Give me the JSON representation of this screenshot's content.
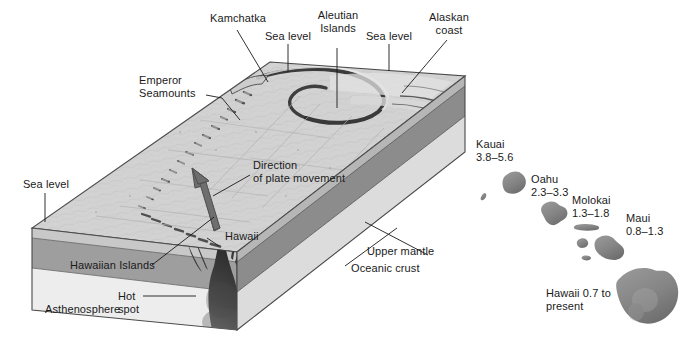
{
  "figure": {
    "colors": {
      "seafloor_light": "#d2d2d2",
      "seafloor_mid": "#b8b8b8",
      "crust_band": "#c4c4c4",
      "upper_mantle_band": "#9a9a9a",
      "asthenosphere_band": "#e9e9e9",
      "side_face": "#9d9d9d",
      "plume_dark": "#3a3a3a",
      "island_gray": "#8a8a8a",
      "arrow_gray": "#6e6e6e",
      "leader_line": "#1a1a1a",
      "text": "#1a1a1a"
    }
  },
  "labels": {
    "kamchatka": "Kamchatka",
    "sea_level_top": "Sea level",
    "aleutian_islands": "Aleutian\nIslands",
    "sea_level_top_right": "Sea level",
    "alaskan_coast": "Alaskan\ncoast",
    "emperor_seamounts": "Emperor\nSeamounts",
    "direction_of_plate_movement": "Direction\nof plate movement",
    "sea_level_left": "Sea level",
    "hawaiian_islands": "Hawaiian Islands",
    "asthenosphere": "Asthenosphere",
    "hot_spot": "Hot\nspot",
    "hawaii_block": "Hawaii",
    "upper_mantle": "Upper mantle",
    "oceanic_crust": "Oceanic crust"
  },
  "island_chain": {
    "kauai": {
      "name": "Kauai",
      "age": "3.8–5.6"
    },
    "oahu": {
      "name": "Oahu",
      "age": "2.3–3.3"
    },
    "molokai": {
      "name": "Molokai",
      "age": "1.3–1.8"
    },
    "maui": {
      "name": "Maui",
      "age": "0.8–1.3"
    },
    "hawaii": {
      "name": "Hawaii 0.7 to",
      "age": "present"
    }
  }
}
